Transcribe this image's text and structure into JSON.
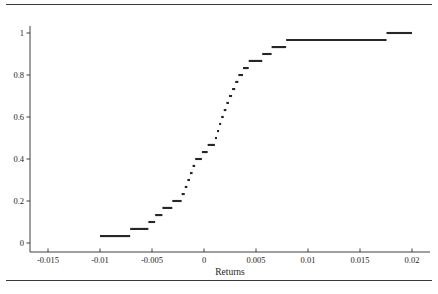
{
  "figure": {
    "background_color": "#ffffff",
    "ink_color": "#262626",
    "top_rule": "horizontal-rule",
    "bottom_rule": "horizontal-rule"
  },
  "chart_data": {
    "type": "line",
    "subtype": "empirical-cdf-step-plot",
    "title": "",
    "subtitle": "",
    "xlabel": "Returns",
    "ylabel": "",
    "xlim": [
      -0.0175,
      0.0215
    ],
    "ylim": [
      -0.02,
      1.04
    ],
    "grid": false,
    "legend": null,
    "xticks": [
      -0.015,
      -0.01,
      -0.005,
      0,
      0.005,
      0.01,
      0.015,
      0.02
    ],
    "xticklabels": [
      "-0.015",
      "-0.01",
      "-0.005",
      "0",
      "0.005",
      "0.01",
      "0.015",
      "0.02"
    ],
    "yticks": [
      0,
      0.2,
      0.4,
      0.6,
      0.8,
      1
    ],
    "yticklabels": [
      "0",
      "0.2",
      "0.4",
      "0.6",
      "0.8",
      "1"
    ],
    "marker": "horizontal-dash",
    "series": [
      {
        "name": "ECDF of Returns",
        "x": [
          -0.01,
          -0.00933,
          -0.00867,
          -0.008,
          -0.00733,
          -0.007,
          -0.00633,
          -0.00567,
          -0.00533,
          -0.005,
          -0.00467,
          -0.00433,
          -0.004,
          -0.00367,
          -0.00333,
          -0.003,
          -0.00267,
          -0.00233,
          -0.00217,
          -0.002,
          -0.00183,
          -0.00167,
          -0.0015,
          -0.00133,
          -0.00117,
          -0.001,
          -0.00083,
          -0.00067,
          -0.0005,
          -0.00033,
          -0.00017,
          0.0,
          0.00017,
          0.00033,
          0.0005,
          0.00067,
          0.00083,
          0.001,
          0.00117,
          0.00133,
          0.0015,
          0.00167,
          0.00183,
          0.002,
          0.00233,
          0.00267,
          0.003,
          0.00333,
          0.00367,
          0.004,
          0.00433,
          0.00467,
          0.00533,
          0.006,
          0.00667,
          0.00733,
          0.0175,
          0.02
        ],
        "y": [
          0.033,
          0.033,
          0.033,
          0.033,
          0.067,
          0.067,
          0.1,
          0.133,
          0.133,
          0.167,
          0.167,
          0.2,
          0.2,
          0.2,
          0.233,
          0.267,
          0.3,
          0.333,
          0.367,
          0.4,
          0.4,
          0.4,
          0.433,
          0.433,
          0.433,
          0.433,
          0.467,
          0.467,
          0.5,
          0.533,
          0.567,
          0.6,
          0.6,
          0.633,
          0.667,
          0.667,
          0.7,
          0.733,
          0.733,
          0.767,
          0.767,
          0.8,
          0.8,
          0.833,
          0.833,
          0.867,
          0.867,
          0.867,
          0.9,
          0.9,
          0.933,
          0.933,
          0.967,
          0.967,
          0.967,
          0.967,
          0.967,
          1.0
        ],
        "color": "#262626"
      }
    ],
    "segments": [
      {
        "x0": -0.01,
        "x1": -0.0071,
        "y": 0.033
      },
      {
        "x0": -0.0071,
        "x1": -0.00535,
        "y": 0.067
      },
      {
        "x0": -0.00535,
        "x1": -0.0047,
        "y": 0.1
      },
      {
        "x0": -0.0047,
        "x1": -0.004,
        "y": 0.133
      },
      {
        "x0": -0.004,
        "x1": -0.00305,
        "y": 0.167
      },
      {
        "x0": -0.00305,
        "x1": -0.00215,
        "y": 0.2
      },
      {
        "x0": -0.00215,
        "x1": -0.00185,
        "y": 0.233
      },
      {
        "x0": -0.00185,
        "x1": -0.0016,
        "y": 0.267
      },
      {
        "x0": -0.0016,
        "x1": -0.00135,
        "y": 0.3
      },
      {
        "x0": -0.00135,
        "x1": -0.0011,
        "y": 0.333
      },
      {
        "x0": -0.0011,
        "x1": -0.00085,
        "y": 0.367
      },
      {
        "x0": -0.00085,
        "x1": -0.0002,
        "y": 0.4
      },
      {
        "x0": -0.0002,
        "x1": 0.00035,
        "y": 0.433
      },
      {
        "x0": 0.00035,
        "x1": 0.00105,
        "y": 0.467
      },
      {
        "x0": 0.00105,
        "x1": 0.00125,
        "y": 0.5
      },
      {
        "x0": 0.00125,
        "x1": 0.00145,
        "y": 0.533
      },
      {
        "x0": 0.00145,
        "x1": 0.00165,
        "y": 0.567
      },
      {
        "x0": 0.00165,
        "x1": 0.0019,
        "y": 0.6
      },
      {
        "x0": 0.0019,
        "x1": 0.00215,
        "y": 0.633
      },
      {
        "x0": 0.00215,
        "x1": 0.0024,
        "y": 0.667
      },
      {
        "x0": 0.0024,
        "x1": 0.0027,
        "y": 0.7
      },
      {
        "x0": 0.0027,
        "x1": 0.003,
        "y": 0.733
      },
      {
        "x0": 0.003,
        "x1": 0.0033,
        "y": 0.767
      },
      {
        "x0": 0.0033,
        "x1": 0.00375,
        "y": 0.8
      },
      {
        "x0": 0.00375,
        "x1": 0.0043,
        "y": 0.833
      },
      {
        "x0": 0.0043,
        "x1": 0.0056,
        "y": 0.867
      },
      {
        "x0": 0.0056,
        "x1": 0.0065,
        "y": 0.9
      },
      {
        "x0": 0.0065,
        "x1": 0.0079,
        "y": 0.933
      },
      {
        "x0": 0.0079,
        "x1": 0.01755,
        "y": 0.967
      },
      {
        "x0": 0.01755,
        "x1": 0.02,
        "y": 1.0
      }
    ]
  }
}
